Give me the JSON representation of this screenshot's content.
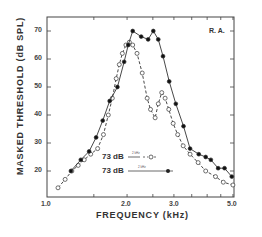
{
  "chart_data": {
    "type": "line",
    "title": "",
    "annotation": "R. A.",
    "xlabel": "FREQUENCY (kHz)",
    "ylabel": "MASKED THRESHOLD (dB SPL)",
    "xscale": "log",
    "xlim": [
      1.0,
      5.0
    ],
    "ylim": [
      11,
      75
    ],
    "x_tick_labels": [
      "1.0",
      "2.0",
      "3.0",
      "5.0"
    ],
    "y_tick_labels": [
      "20",
      "30",
      "40",
      "50",
      "60",
      "70"
    ],
    "grid": false,
    "legend_position": "lower center, inside",
    "series": [
      {
        "name": "73 dB (2 kHz, 3 kHz masker) - open circles, dashed",
        "legend_label": "73 dB",
        "legend_sublabel": "2 kHz",
        "marker": "open-circle",
        "line": "dashed",
        "x": [
          1.1,
          1.17,
          1.24,
          1.31,
          1.38,
          1.46,
          1.55,
          1.63,
          1.7,
          1.76,
          1.82,
          1.87,
          1.92,
          1.98,
          2.04,
          2.1,
          2.18,
          2.28,
          2.38,
          2.45,
          2.55,
          2.62,
          2.7,
          2.78,
          2.87,
          2.98,
          3.1,
          3.25,
          3.45,
          3.7,
          3.95,
          4.3,
          4.6,
          5.0
        ],
        "y": [
          14,
          17,
          20,
          22,
          24,
          26,
          28,
          33,
          40,
          46,
          53,
          58,
          62,
          65,
          66,
          65,
          62,
          55,
          46,
          42,
          39,
          44,
          48,
          46,
          42,
          37,
          33,
          29,
          26,
          23,
          20,
          18,
          16,
          15
        ]
      },
      {
        "name": "73 dB (2 kHz + 2.6 kHz masker) - filled circles, solid",
        "legend_label": "73 dB",
        "legend_sublabel": "2 kHz",
        "marker": "filled-circle",
        "line": "solid",
        "x": [
          1.23,
          1.34,
          1.44,
          1.53,
          1.62,
          1.72,
          1.84,
          1.95,
          2.02,
          2.1,
          2.26,
          2.4,
          2.51,
          2.62,
          2.73,
          2.88,
          3.05,
          3.26,
          3.45,
          3.72,
          3.95,
          4.13,
          4.4,
          4.65,
          4.95
        ],
        "y": [
          20,
          24,
          27,
          32,
          38,
          45,
          50,
          59,
          65,
          70,
          68,
          67,
          70,
          67,
          61,
          52,
          44,
          36,
          28,
          26,
          25,
          24,
          21,
          21,
          18
        ]
      }
    ]
  },
  "axes": {
    "xlabel": "FREQUENCY (kHz)",
    "ylabel": "MASKED THRESHOLD (dB SPL)",
    "x_ticks": [
      "1.0",
      "2.0",
      "3.0",
      "5.0"
    ],
    "y_ticks": [
      "70",
      "60",
      "50",
      "40",
      "30",
      "20"
    ]
  },
  "annotation": "R. A.",
  "legend": {
    "entry1": {
      "label": "73 dB",
      "sublabel": "2 kHz"
    },
    "entry2": {
      "label": "73 dB",
      "sublabel": "2 kHz"
    }
  }
}
